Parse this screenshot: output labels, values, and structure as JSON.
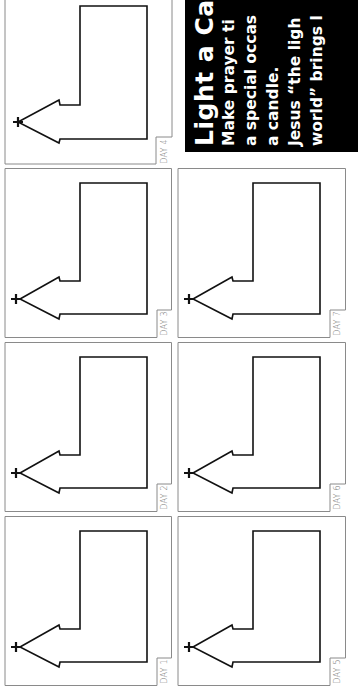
{
  "infobox": {
    "title": "Light a Can",
    "lines": [
      "Make prayer ti",
      "a special occas",
      "a candle.",
      "Jesus “the ligh",
      "world” brings l"
    ],
    "background": "#000000",
    "text_color": "#ffffff"
  },
  "panels": [
    {
      "label": "DAY 4",
      "column": 1,
      "row": 1
    },
    {
      "label": "DAY 3",
      "column": 1,
      "row": 2
    },
    {
      "label": "DAY 2",
      "column": 1,
      "row": 3
    },
    {
      "label": "DAY 1",
      "column": 1,
      "row": 4
    },
    {
      "label": "DAY 7",
      "column": 2,
      "row": 2
    },
    {
      "label": "DAY 6",
      "column": 2,
      "row": 3
    },
    {
      "label": "DAY 5",
      "column": 2,
      "row": 4
    }
  ],
  "candle_icon": "candle-outline-with-flame-and-cross",
  "colors": {
    "panel_border": "#8a8a8a",
    "candle_stroke": "#111111",
    "label_text": "#777777"
  }
}
